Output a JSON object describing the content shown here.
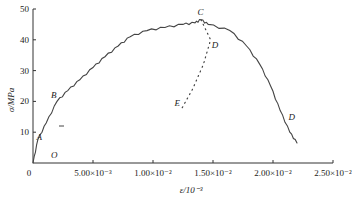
{
  "chart_data": {
    "type": "line",
    "title": "",
    "xlabel": "ε/10⁻³",
    "ylabel": "σ/MPa",
    "xlim": [
      0,
      0.025
    ],
    "ylim": [
      0,
      50
    ],
    "grid": false,
    "x_ticks": [
      {
        "value": 0,
        "label": "0"
      },
      {
        "value": 0.005,
        "label": "5.00×10⁻³"
      },
      {
        "value": 0.01,
        "label": "1.00×10⁻²"
      },
      {
        "value": 0.015,
        "label": "1.50×10⁻²"
      },
      {
        "value": 0.02,
        "label": "2.00×10⁻²"
      },
      {
        "value": 0.025,
        "label": "2.50×10⁻²"
      }
    ],
    "y_ticks": [
      {
        "value": 10,
        "label": "10"
      },
      {
        "value": 20,
        "label": "20"
      },
      {
        "value": 30,
        "label": "30"
      },
      {
        "value": 40,
        "label": "40"
      },
      {
        "value": 50,
        "label": "50"
      }
    ],
    "series": [
      {
        "name": "stress-strain (solid)",
        "style": "solid",
        "x": [
          0,
          0.0004,
          0.0011,
          0.002,
          0.0029,
          0.0039,
          0.005,
          0.006,
          0.0071,
          0.0081,
          0.0095,
          0.011,
          0.0125,
          0.0135,
          0.014,
          0.0146,
          0.0164,
          0.0178,
          0.0189,
          0.0198,
          0.0206,
          0.0214,
          0.022
        ],
        "y": [
          0,
          7.5,
          13,
          20,
          23.5,
          27,
          31,
          34.5,
          38,
          41,
          43,
          44,
          45,
          45.5,
          46.5,
          45,
          43,
          38,
          32,
          25,
          17,
          10,
          6.5
        ]
      },
      {
        "name": "unloading path C-D-E (dotted)",
        "style": "dotted",
        "x": [
          0.014,
          0.0148,
          0.0142,
          0.0133,
          0.0123
        ],
        "y": [
          46.5,
          40,
          32,
          24,
          17
        ]
      }
    ],
    "annotations": [
      {
        "label": "O",
        "x": 0.0015,
        "y": 1.5
      },
      {
        "label": "A",
        "x": 0.0003,
        "y": 7.5
      },
      {
        "label": "B",
        "x": 0.0015,
        "y": 21
      },
      {
        "label": "C",
        "x": 0.0137,
        "y": 48
      },
      {
        "label": "D",
        "x": 0.0149,
        "y": 37.5
      },
      {
        "label": "E",
        "x": 0.0118,
        "y": 18.5
      },
      {
        "label": "D",
        "x": 0.0213,
        "y": 14
      }
    ]
  }
}
